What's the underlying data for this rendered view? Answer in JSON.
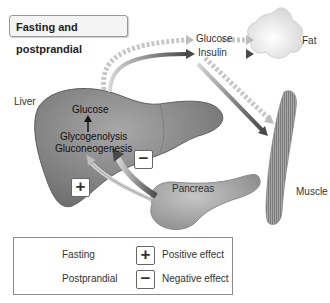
{
  "title": "Fasting and postprandial",
  "labels": {
    "glucose_top": "Glucose",
    "insulin": "Insulin",
    "fat": "Fat",
    "liver": "Liver",
    "liver_glucose": "Glucose",
    "glycogenolysis": "Glycogenolysis",
    "gluconeogenesis": "Gluconeogenesis",
    "pancreas": "Pancreas",
    "muscle": "Muscle"
  },
  "signs": {
    "plus": "+",
    "minus": "−"
  },
  "legend": {
    "fasting": "Fasting",
    "postprandial": "Postprandial",
    "positive": "Positive effect",
    "negative": "Negative effect",
    "plus_symbol": "+",
    "minus_symbol": "−"
  },
  "colors": {
    "fasting_arrow": "#c8c8c8",
    "postprandial_arrow": "#5a5a5a",
    "liver": "#8a8a8a",
    "fat": "#ececec",
    "pancreas": "#a8a8a8",
    "muscle": "#9a9a9a"
  }
}
